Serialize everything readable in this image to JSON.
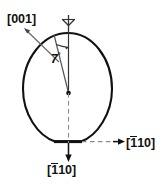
{
  "figure": {
    "caption": "Crystal orientation schematic of an elliptical wafer with flat",
    "shape": {
      "name": "wafer-ellipse",
      "outline_color": "#111111",
      "fill_color": "#ffffff",
      "has_flat": true,
      "flat_position": "bottom"
    },
    "labels": {
      "surface_normal": {
        "text_prefix": "[",
        "indices": "001",
        "text_suffix": "]",
        "full": "[001]",
        "position": "top-left"
      },
      "flat_direction": {
        "text_prefix": "[",
        "index_bar": "1",
        "indices_rest": "10",
        "text_suffix": "]",
        "full": "[110]",
        "position": "bottom-center"
      },
      "in_plane_direction": {
        "text_prefix": "[",
        "index_bar": "1",
        "indices_rest": "10",
        "text_suffix": "]",
        "full": "[110]",
        "position": "right"
      },
      "tilt_angle": {
        "value": "7",
        "unit": "°",
        "full": "7°"
      }
    },
    "markers": {
      "rotation_axis": "vertical-axis-arrow",
      "center_point": "origin-dot",
      "arc": "angle-arc",
      "vertical_dashed": "dashed-axis-line",
      "horizontal_dashed": "dashed-direction-line"
    },
    "colors": {
      "line": "#111111",
      "dashed": "#777777",
      "background": "#ffffff"
    }
  }
}
